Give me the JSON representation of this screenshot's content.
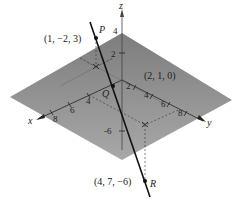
{
  "figure": {
    "axes": {
      "x_label": "x",
      "y_label": "y",
      "z_label": "z",
      "x_ticks": [
        "4",
        "6",
        "8"
      ],
      "y_ticks": [
        "2",
        "4",
        "6",
        "8"
      ],
      "z_ticks": [
        "4",
        "2",
        "-6"
      ]
    },
    "points": {
      "P": {
        "name": "P",
        "coords": "(1, −2, 3)"
      },
      "Q": {
        "name": "Q",
        "coords": "(2, 1, 0)"
      },
      "R": {
        "name": "R",
        "coords": "(4, 7, −6)"
      }
    },
    "colors": {
      "plane": "#8a8a8a",
      "line": "#111111",
      "axis": "#333333"
    }
  }
}
